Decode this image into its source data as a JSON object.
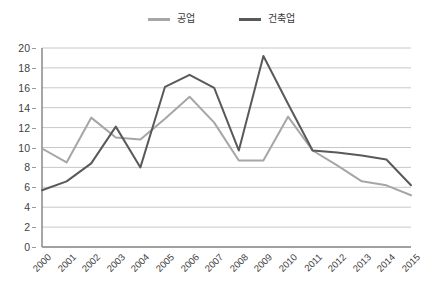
{
  "chart_data": {
    "type": "line",
    "title": "",
    "xlabel": "",
    "ylabel": "",
    "ylim": [
      0,
      20
    ],
    "ytick_step": 2,
    "yticks": [
      0,
      2,
      4,
      6,
      8,
      10,
      12,
      14,
      16,
      18,
      20
    ],
    "grid": true,
    "grid_axis": "y",
    "legend_position": "top-center",
    "categories": [
      "2000",
      "2001",
      "2002",
      "2003",
      "2004",
      "2005",
      "2006",
      "2007",
      "2008",
      "2009",
      "2010",
      "2011",
      "2012",
      "2013",
      "2014",
      "2015"
    ],
    "series": [
      {
        "name": "공업",
        "color": "#a6a6a6",
        "values": [
          9.9,
          8.5,
          13.0,
          11.0,
          10.8,
          12.9,
          15.1,
          12.5,
          8.7,
          8.7,
          13.1,
          9.7,
          8.2,
          6.6,
          6.2,
          5.2
        ]
      },
      {
        "name": "건축업",
        "color": "#595959",
        "values": [
          5.7,
          6.6,
          8.4,
          12.1,
          8.0,
          16.1,
          17.3,
          16.0,
          9.7,
          19.2,
          14.4,
          9.7,
          9.5,
          9.2,
          8.8,
          6.2
        ]
      }
    ]
  },
  "legend": {
    "items": [
      {
        "label": "공업",
        "color": "#a6a6a6"
      },
      {
        "label": "건축업",
        "color": "#595959"
      }
    ]
  },
  "colors": {
    "series_light": "#a6a6a6",
    "series_dark": "#595959",
    "gridline": "#c8c8c8",
    "axis": "#808080",
    "text": "#3f3f3f",
    "background": "#ffffff"
  }
}
